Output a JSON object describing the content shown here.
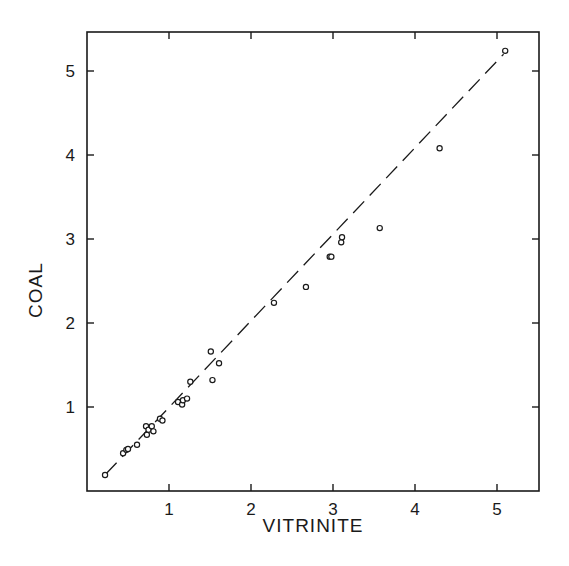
{
  "chart_data": {
    "type": "scatter",
    "title": "",
    "xlabel": "VITRINITE",
    "ylabel": "COAL",
    "xlim": [
      0,
      5.5
    ],
    "ylim": [
      0,
      5.5
    ],
    "xticks": [
      1,
      2,
      3,
      4,
      5
    ],
    "yticks": [
      1,
      2,
      3,
      4,
      5
    ],
    "xtick_labels": [
      "1",
      "2",
      "3",
      "4",
      "5"
    ],
    "ytick_labels": [
      "1",
      "2",
      "3",
      "4",
      "5"
    ],
    "grid": false,
    "legend": null,
    "ticks_on_all_sides": true,
    "series": [
      {
        "name": "samples",
        "marker": "open-circle",
        "points": [
          {
            "x": 0.22,
            "y": 0.19
          },
          {
            "x": 0.44,
            "y": 0.45
          },
          {
            "x": 0.48,
            "y": 0.49
          },
          {
            "x": 0.5,
            "y": 0.5
          },
          {
            "x": 0.61,
            "y": 0.55
          },
          {
            "x": 0.72,
            "y": 0.77
          },
          {
            "x": 0.73,
            "y": 0.67
          },
          {
            "x": 0.75,
            "y": 0.73
          },
          {
            "x": 0.79,
            "y": 0.77
          },
          {
            "x": 0.81,
            "y": 0.71
          },
          {
            "x": 0.89,
            "y": 0.86
          },
          {
            "x": 0.92,
            "y": 0.84
          },
          {
            "x": 1.11,
            "y": 1.06
          },
          {
            "x": 1.16,
            "y": 1.03
          },
          {
            "x": 1.17,
            "y": 1.08
          },
          {
            "x": 1.22,
            "y": 1.1
          },
          {
            "x": 1.26,
            "y": 1.3
          },
          {
            "x": 1.51,
            "y": 1.66
          },
          {
            "x": 1.53,
            "y": 1.32
          },
          {
            "x": 1.61,
            "y": 1.52
          },
          {
            "x": 2.28,
            "y": 2.24
          },
          {
            "x": 2.67,
            "y": 2.43
          },
          {
            "x": 2.96,
            "y": 2.79
          },
          {
            "x": 2.98,
            "y": 2.79
          },
          {
            "x": 3.1,
            "y": 2.96
          },
          {
            "x": 3.11,
            "y": 3.02
          },
          {
            "x": 3.57,
            "y": 3.13
          },
          {
            "x": 4.3,
            "y": 4.08
          },
          {
            "x": 5.1,
            "y": 5.24
          }
        ]
      },
      {
        "name": "fit line",
        "style": "dashed",
        "points": [
          {
            "x": 0.3,
            "y": 0.27
          },
          {
            "x": 5.08,
            "y": 5.2
          }
        ]
      }
    ]
  },
  "axes": {
    "x_title": "VITRINITE",
    "y_title": "COAL"
  },
  "colors": {
    "ink": "#1a1a1a",
    "background": "#ffffff"
  }
}
